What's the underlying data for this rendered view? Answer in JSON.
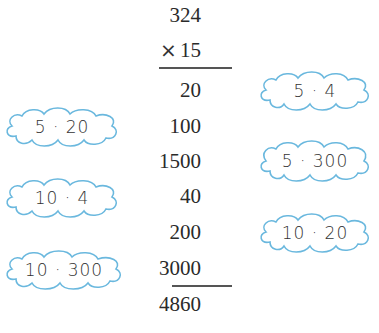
{
  "problem": {
    "multiplicand": "324",
    "operator": "×",
    "multiplier": "15",
    "partial_products": [
      "20",
      "100",
      "1500",
      "40",
      "200",
      "3000"
    ],
    "result": "4860"
  },
  "clouds": {
    "right": [
      {
        "label": "5 · 4"
      },
      {
        "label": "5 · 300"
      },
      {
        "label": "10 · 20"
      }
    ],
    "left": [
      {
        "label": "5 · 20"
      },
      {
        "label": "10 · 4"
      },
      {
        "label": "10 · 300"
      }
    ]
  },
  "colors": {
    "cloud_stroke": "#6ab8de",
    "text": "#2a2a2a"
  }
}
